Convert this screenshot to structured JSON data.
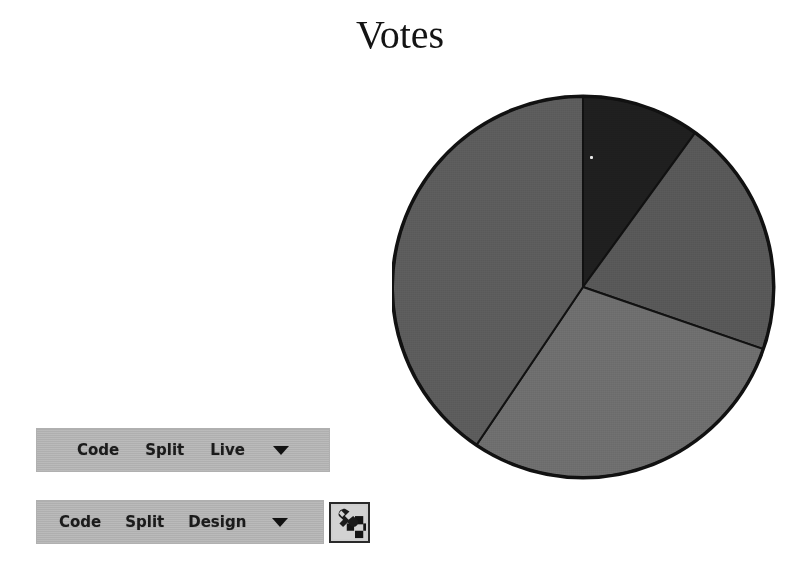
{
  "page": {
    "background_color": "#ffffff",
    "width": 792,
    "height": 576
  },
  "chart_data": {
    "type": "pie",
    "title": "Votes",
    "xlabel": "",
    "ylabel": "",
    "grid": false,
    "legend": "none",
    "start_angle_deg": 0,
    "direction": "clockwise",
    "center": [
      583,
      287
    ],
    "radius": 191,
    "categories": [
      "Slice 1",
      "Slice 2",
      "Slice 3",
      "Slice 4"
    ],
    "values": [
      10,
      20,
      29,
      41
    ],
    "slices": [
      {
        "label": "Slice 1",
        "value": 10,
        "percent": 10,
        "start_deg": 0,
        "end_deg": 36,
        "color": "#1f1f1f"
      },
      {
        "label": "Slice 2",
        "value": 20,
        "percent": 20,
        "start_deg": 36,
        "end_deg": 109,
        "color": "#585858"
      },
      {
        "label": "Slice 3",
        "value": 29,
        "percent": 29,
        "start_deg": 109,
        "end_deg": 214,
        "color": "#6e6e6e"
      },
      {
        "label": "Slice 4",
        "value": 41,
        "percent": 41,
        "start_deg": 214,
        "end_deg": 360,
        "color": "#5c5c5c"
      }
    ],
    "edge_color": "#111111",
    "edge_width": 2
  },
  "toolbars": [
    {
      "id": "live-toolbar",
      "background_color": "#b5b5b5",
      "items": [
        {
          "label": "Code",
          "name": "code-button"
        },
        {
          "label": "Split",
          "name": "split-button"
        },
        {
          "label": "Live",
          "name": "live-button"
        }
      ],
      "caret": "▼",
      "has_tool_icon": false
    },
    {
      "id": "design-toolbar",
      "background_color": "#b5b5b5",
      "items": [
        {
          "label": "Code",
          "name": "code-button"
        },
        {
          "label": "Split",
          "name": "split-button"
        },
        {
          "label": "Design",
          "name": "design-button"
        }
      ],
      "caret": "▼",
      "has_tool_icon": true,
      "tool_icon_name": "wrench-tool-icon"
    }
  ]
}
